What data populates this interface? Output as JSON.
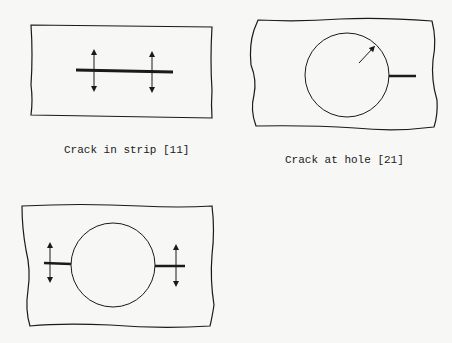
{
  "figures": [
    {
      "id": "strip",
      "caption": "Crack in strip [11]"
    },
    {
      "id": "hole",
      "caption": "Crack at hole [21]"
    },
    {
      "id": "double",
      "caption": ""
    }
  ],
  "colors": {
    "ink": "#1a1a1a",
    "paper": "#f7f7f5"
  }
}
